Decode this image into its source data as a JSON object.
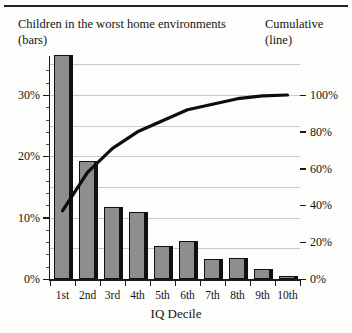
{
  "header": {
    "bars_title_line1": "Children in the worst home environments",
    "bars_title_line2": "(bars)",
    "line_title_line1": "Cumulative",
    "line_title_line2": "(line)"
  },
  "axes": {
    "x_title": "IQ Decile",
    "left_ticks": [
      "0%",
      "10%",
      "20%",
      "30%"
    ],
    "right_ticks": [
      "0%",
      "20%",
      "40%",
      "60%",
      "80%",
      "100%"
    ]
  },
  "chart_data": {
    "type": "bar",
    "xlabel": "IQ Decile",
    "ylabel": "Children in the worst home environments (bars)",
    "y2label": "Cumulative (line)",
    "categories": [
      "1st",
      "2nd",
      "3rd",
      "4th",
      "5th",
      "6th",
      "7th",
      "8th",
      "9th",
      "10th"
    ],
    "ylim": [
      0,
      36.5
    ],
    "y2lim": [
      0,
      100
    ],
    "yticks": [
      0,
      10,
      20,
      30
    ],
    "ytick_labels": [
      "0%",
      "10%",
      "20%",
      "30%"
    ],
    "y2ticks": [
      0,
      20,
      40,
      60,
      80,
      100
    ],
    "y2tick_labels": [
      "0%",
      "20%",
      "40%",
      "60%",
      "80%",
      "100%"
    ],
    "grid": true,
    "legend": "none",
    "series": [
      {
        "name": "Children in the worst home environments (bars)",
        "type": "bar",
        "axis": "left",
        "unit": "%",
        "values": [
          36.5,
          19.3,
          11.8,
          11.0,
          5.3,
          6.2,
          3.2,
          3.5,
          1.7,
          0.5
        ]
      },
      {
        "name": "Cumulative (line)",
        "type": "line",
        "axis": "right",
        "unit": "%",
        "values": [
          37,
          58,
          71,
          80,
          86,
          92,
          95,
          98,
          99.5,
          100
        ]
      }
    ]
  }
}
